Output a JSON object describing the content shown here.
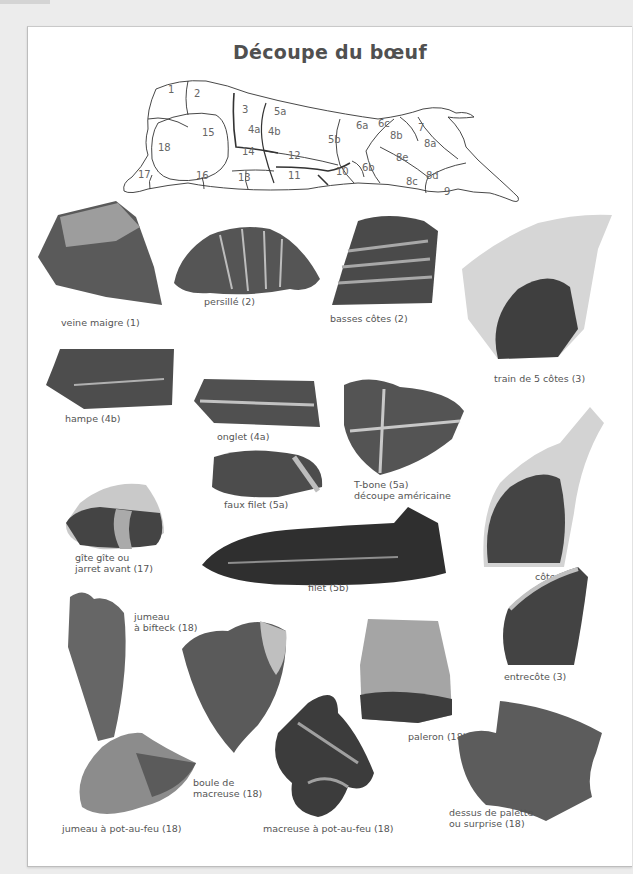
{
  "page": {
    "title": "Découpe du bœuf"
  },
  "diagram": {
    "name": "beef-cuts-diagram",
    "regions": [
      "1",
      "2",
      "3",
      "4a",
      "4b",
      "5a",
      "5b",
      "6a",
      "6b",
      "6c",
      "7",
      "8a",
      "8b",
      "8c",
      "8d",
      "8e",
      "9",
      "10",
      "11",
      "12",
      "13",
      "14",
      "15",
      "16",
      "17",
      "18"
    ]
  },
  "cuts": [
    {
      "id": "veine-maigre",
      "label": "veine maigre (1)"
    },
    {
      "id": "persille",
      "label": "persillé (2)"
    },
    {
      "id": "basses-cotes",
      "label": "basses côtes (2)"
    },
    {
      "id": "train-5-cotes",
      "label": "train de 5 côtes (3)"
    },
    {
      "id": "hampe",
      "label": "hampe (4b)"
    },
    {
      "id": "onglet",
      "label": "onglet (4a)"
    },
    {
      "id": "t-bone",
      "label_line1": "T-bone (5a)",
      "label_line2": "découpe américaine"
    },
    {
      "id": "faux-filet",
      "label": "faux filet (5a)"
    },
    {
      "id": "gite",
      "label_line1": "gîte gîte ou",
      "label_line2": "jarret avant (17)"
    },
    {
      "id": "cote",
      "label": "côte (3)"
    },
    {
      "id": "filet",
      "label": "filet (5b)"
    },
    {
      "id": "jumeau-bifteck",
      "label_line1": "jumeau",
      "label_line2": "à bifteck (18)"
    },
    {
      "id": "entrecote",
      "label": "entrecôte (3)"
    },
    {
      "id": "boule-macreuse",
      "label_line1": "boule de",
      "label_line2": "macreuse (18)"
    },
    {
      "id": "paleron",
      "label": "paleron (18)"
    },
    {
      "id": "jumeau-pot-au-feu",
      "label": "jumeau à pot-au-feu (18)"
    },
    {
      "id": "macreuse-pot-au-feu",
      "label": "macreuse à pot-au-feu (18)"
    },
    {
      "id": "dessus-palette",
      "label_line1": "dessus de palette",
      "label_line2": "ou surprise (18)"
    }
  ],
  "colors": {
    "background": "#ececec",
    "page": "#ffffff",
    "text": "#555555",
    "meat_dark": "#3f3f3f",
    "meat_mid": "#5e5e5e",
    "fat": "#cfcfcf"
  }
}
